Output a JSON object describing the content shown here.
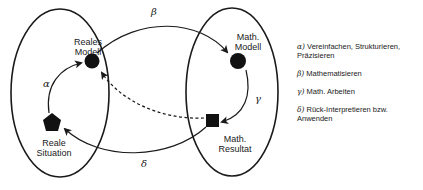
{
  "nodes": {
    "reales_modell": {
      "label_line1": "Reales",
      "label_line2": "Modell",
      "shape": "circle"
    },
    "reale_situation": {
      "label_line1": "Reale",
      "label_line2": "Situation",
      "shape": "pentagon"
    },
    "math_modell": {
      "label_line1": "Math.",
      "label_line2": "Modell",
      "shape": "circle"
    },
    "math_resultat": {
      "label_line1": "Math.",
      "label_line2": "Resultat",
      "shape": "square"
    }
  },
  "arrows": {
    "alpha": "α",
    "beta": "β",
    "gamma": "γ",
    "delta": "δ"
  },
  "legend": {
    "items": [
      {
        "symbol": "α)",
        "text": " Vereinfachen, Strukturieren, Präzisieren"
      },
      {
        "symbol": "β)",
        "text": " Mathematisieren"
      },
      {
        "symbol": "γ)",
        "text": " Math. Arbeiten"
      },
      {
        "symbol": "δ)",
        "text": " Rück-Interpretieren bzw. Anwenden"
      }
    ]
  },
  "colors": {
    "stroke": "#1a1a1a",
    "fill": "#111111",
    "background": "#ffffff"
  }
}
